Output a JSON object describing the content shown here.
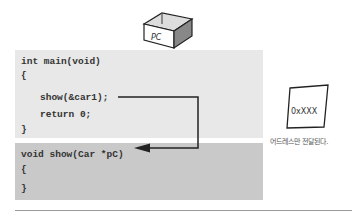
{
  "pc_box": {
    "label": "PC"
  },
  "main_function": {
    "lines": [
      "int main(void)",
      "{",
      "show(&car1);",
      "return 0;",
      "}"
    ]
  },
  "show_function": {
    "lines": [
      "void show(Car *pC)",
      "{",
      "}"
    ]
  },
  "note": {
    "value": "0xXXX",
    "caption": "어드레스만 전달된다."
  },
  "colors": {
    "main_bg": "#e8e8e8",
    "show_bg": "#c9c9c9",
    "line": "#222222"
  }
}
